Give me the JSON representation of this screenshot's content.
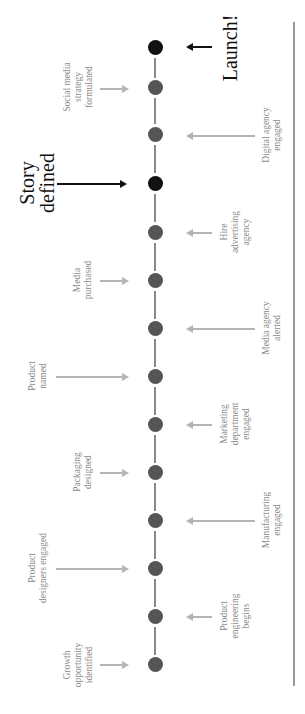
{
  "diagram": {
    "type": "timeline",
    "orientation": "rotated-90-ccw",
    "colors": {
      "milestone_dot": "#555555",
      "key_dot": "#111111",
      "connector": "#8a8a8a",
      "gray_arrow": "#b4b4b4",
      "label": "#8a8a8a",
      "key_label": "#111111",
      "rule": "#9a9a9a"
    },
    "key_events": {
      "launch": "Launch!",
      "story": "Story\ndefined"
    },
    "events_top": {
      "growth": "Growth\nopportunity\nidentified",
      "designers": "Product\ndesigners engaged",
      "packaging": "Packaging\ndesigned",
      "named": "Product\nnamed",
      "media_purchased": "Media\npurchased",
      "social": "Social media\nstrategy\nformulated"
    },
    "events_bottom": {
      "engineering": "Product\nengineering\nbegins",
      "manufacturing": "Manufacturing\nengaged",
      "marketing": "Marketing\ndepartment\nengaged",
      "media_agency": "Media agency\nalerted",
      "ad_agency": "Hire\nadvertising\nagency",
      "digital": "Digital agency\nengaged"
    },
    "sequence": [
      "Growth opportunity identified",
      "Product engineering begins",
      "Product designers engaged",
      "Manufacturing engaged",
      "Packaging designed",
      "Marketing department engaged",
      "Product named",
      "Media agency alerted",
      "Media purchased",
      "Hire advertising agency",
      "Story defined",
      "Digital agency engaged",
      "Social media strategy formulated",
      "Launch!"
    ]
  }
}
